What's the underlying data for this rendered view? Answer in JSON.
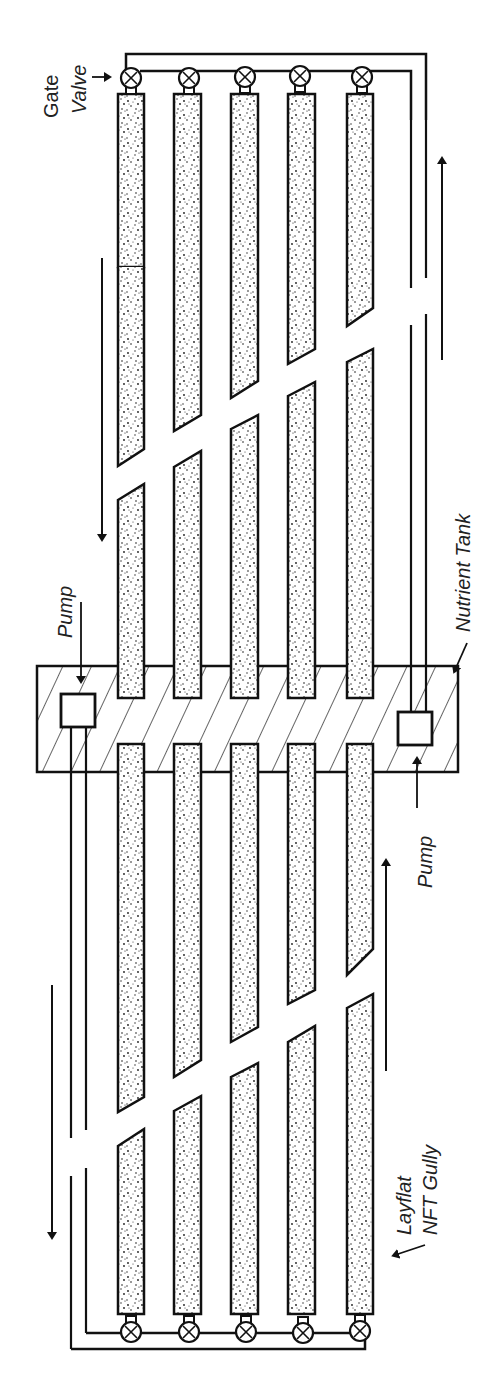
{
  "diagram": {
    "type": "NFT hydroponic system schematic (plan view, rotated 90°)",
    "labels": {
      "gate_valve_1": "Gate",
      "gate_valve_2": "Valve",
      "pump_left": "Pump",
      "pump_right": "Pump",
      "nutrient_tank": "Nutrient Tank",
      "gully_1": "Layflat",
      "gully_2": "NFT Gully"
    },
    "components": {
      "nutrient_tank": {
        "fill": "hatched",
        "count": 1
      },
      "pumps": {
        "count": 2
      },
      "gullies_per_side": 5,
      "sides": 2,
      "gate_valves_per_side": 5
    },
    "flow_arrows": [
      {
        "id": "top-left-down",
        "direction": "down"
      },
      {
        "id": "top-right-up",
        "direction": "up"
      },
      {
        "id": "bottom-right-up",
        "direction": "up"
      },
      {
        "id": "bottom-left-down",
        "direction": "down"
      }
    ],
    "colors": {
      "line": "#111111",
      "background": "#ffffff",
      "stipple": "#1a1a1a"
    }
  }
}
